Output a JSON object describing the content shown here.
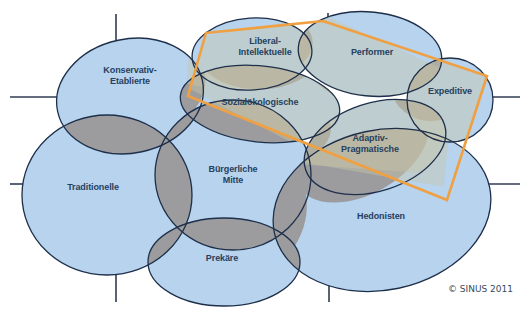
{
  "colors": {
    "milieu_fill": "#b7d3ee",
    "overlap_fill": "#9c9c9f",
    "outline": "#1e2f4a",
    "highlight_outline": "#f0a040",
    "highlight_fill": "#c6c9bf",
    "axis_line": "#2f3c52",
    "label": "#26405e"
  },
  "milieus": [
    {
      "id": "konservativ-etablierte",
      "label_line1": "Konservativ-",
      "label_line2": "Etablierte",
      "cx": 130,
      "cy": 96,
      "rx": 74,
      "ry": 57,
      "rot": -12,
      "lx": 130,
      "ly": 76
    },
    {
      "id": "liberal-intellektuelle",
      "label_line1": "Liberal-",
      "label_line2": "Intellektuelle",
      "cx": 252,
      "cy": 54,
      "rx": 60,
      "ry": 36,
      "rot": -4,
      "lx": 265,
      "ly": 47
    },
    {
      "id": "performer",
      "label_line1": "Performer",
      "label_line2": "",
      "cx": 370,
      "cy": 54,
      "rx": 72,
      "ry": 42,
      "rot": 6,
      "lx": 372,
      "ly": 52
    },
    {
      "id": "expeditive",
      "label_line1": "Expeditive",
      "label_line2": "",
      "cx": 450,
      "cy": 100,
      "rx": 43,
      "ry": 42,
      "rot": 0,
      "lx": 450,
      "ly": 91
    },
    {
      "id": "sozialoekologische",
      "label_line1": "Sozialökologische",
      "label_line2": "",
      "cx": 260,
      "cy": 104,
      "rx": 80,
      "ry": 38,
      "rot": 6,
      "lx": 260,
      "ly": 102
    },
    {
      "id": "adaptiv-pragmatische",
      "label_line1": "Adaptiv-",
      "label_line2": "Pragmatische",
      "cx": 375,
      "cy": 147,
      "rx": 73,
      "ry": 44,
      "rot": -18,
      "lx": 370,
      "ly": 144
    },
    {
      "id": "traditionelle",
      "label_line1": "Traditionelle",
      "label_line2": "",
      "cx": 107,
      "cy": 195,
      "rx": 85,
      "ry": 80,
      "rot": 0,
      "lx": 93,
      "ly": 187
    },
    {
      "id": "buergerliche-mitte",
      "label_line1": "Bürgerliche",
      "label_line2": "Mitte",
      "cx": 233,
      "cy": 175,
      "rx": 78,
      "ry": 75,
      "rot": 0,
      "lx": 233,
      "ly": 175
    },
    {
      "id": "hedonisten",
      "label_line1": "Hedonisten",
      "label_line2": "",
      "cx": 382,
      "cy": 210,
      "rx": 110,
      "ry": 80,
      "rot": -12,
      "lx": 381,
      "ly": 216
    },
    {
      "id": "prekaere",
      "label_line1": "Prekäre",
      "label_line2": "",
      "cx": 224,
      "cy": 262,
      "rx": 76,
      "ry": 44,
      "rot": 0,
      "lx": 222,
      "ly": 258
    }
  ],
  "axis_lines": [
    {
      "x1": 116,
      "y1": 14,
      "x2": 116,
      "y2": 55
    },
    {
      "x1": 10,
      "y1": 97,
      "x2": 66,
      "y2": 97
    },
    {
      "x1": 10,
      "y1": 184,
      "x2": 28,
      "y2": 184
    },
    {
      "x1": 116,
      "y1": 272,
      "x2": 116,
      "y2": 302
    },
    {
      "x1": 328,
      "y1": 13,
      "x2": 328,
      "y2": 22
    },
    {
      "x1": 487,
      "y1": 97,
      "x2": 520,
      "y2": 97
    },
    {
      "x1": 452,
      "y1": 184,
      "x2": 520,
      "y2": 184
    },
    {
      "x1": 329,
      "y1": 273,
      "x2": 329,
      "y2": 302
    }
  ],
  "highlight_polygon": "206,33 323,21 487,76 447,200 188,96",
  "copyright": "© SINUS 2011"
}
